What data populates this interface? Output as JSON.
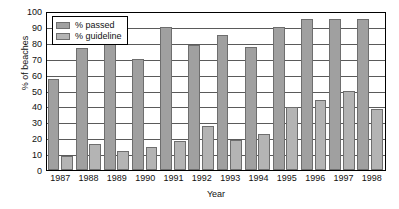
{
  "chart_data": {
    "type": "bar",
    "title": "",
    "xlabel": "Year",
    "ylabel": "% of beaches",
    "categories": [
      "1987",
      "1988",
      "1989",
      "1990",
      "1991",
      "1992",
      "1993",
      "1994",
      "1995",
      "1996",
      "1997",
      "1998"
    ],
    "series": [
      {
        "name": "% passed",
        "color": "#a0a0a0",
        "values": [
          57,
          77,
          82.5,
          70,
          90,
          78.5,
          85,
          77.5,
          90,
          95,
          95,
          95
        ]
      },
      {
        "name": "% guideline",
        "color": "#b4b4b4",
        "values": [
          9,
          16.5,
          12,
          14.5,
          18.5,
          27.5,
          19,
          22.5,
          39.5,
          44,
          50,
          38.5
        ]
      }
    ],
    "ylim": [
      0,
      100
    ],
    "ytick_step": 10,
    "yticks": [
      "100",
      "90",
      "80",
      "70",
      "60",
      "50",
      "40",
      "30",
      "20",
      "10",
      "0"
    ],
    "grid": true,
    "legend_position": "top-left"
  },
  "legend": {
    "items": [
      {
        "label": "% passed"
      },
      {
        "label": "% guideline"
      }
    ]
  },
  "axes": {
    "y_title": "% of beaches",
    "x_title": "Year"
  }
}
